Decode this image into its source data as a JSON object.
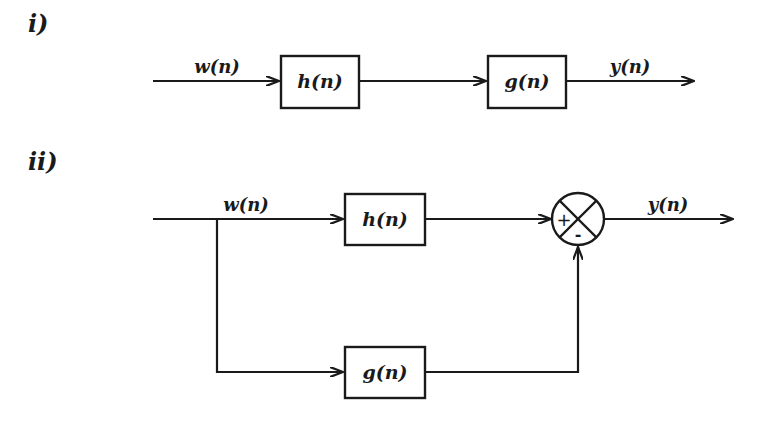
{
  "diagram_i": {
    "section_label": "i)",
    "input_label": "w(n)",
    "blocks": [
      {
        "label": "h(n)"
      },
      {
        "label": "g(n)"
      }
    ],
    "output_label": "y(n)",
    "description": "Cascade (series) connection of h(n) and g(n)"
  },
  "diagram_ii": {
    "section_label": "ii)",
    "input_label": "w(n)",
    "blocks": [
      {
        "label": "h(n)"
      },
      {
        "label": "g(n)"
      }
    ],
    "summing_junction": {
      "plus_sign": "+",
      "minus_sign": "-"
    },
    "output_label": "y(n)",
    "description": "Parallel connection: h(n) path minus g(n) path"
  },
  "colors": {
    "ink": "#1a1a1a",
    "background": "#ffffff"
  }
}
